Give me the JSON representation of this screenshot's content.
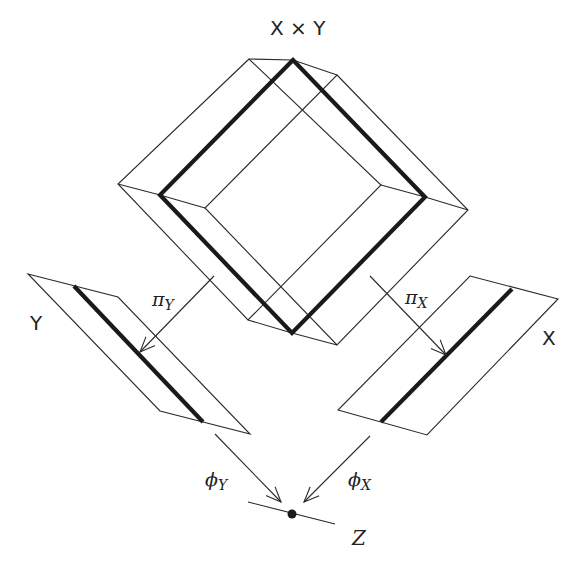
{
  "labels": {
    "product": "X × Y",
    "space_y": "Y",
    "space_x": "X",
    "space_z": "Z"
  },
  "maps": {
    "proj_y": {
      "symbol": "π",
      "subscript": "Y"
    },
    "proj_x": {
      "symbol": "π",
      "subscript": "X"
    },
    "phi_y": {
      "symbol": "ϕ",
      "subscript": "Y"
    },
    "phi_x": {
      "symbol": "ϕ",
      "subscript": "X"
    }
  },
  "colors": {
    "line": "#2a2a2a",
    "thick_line": "#1a1a1a",
    "background": "#ffffff"
  }
}
